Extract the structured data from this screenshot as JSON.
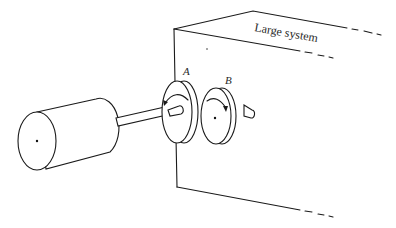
{
  "diagram": {
    "box_label": "Large system",
    "gear_a_label": "A",
    "gear_b_label": "B",
    "components": [
      {
        "name": "motor-cylinder"
      },
      {
        "name": "shaft"
      },
      {
        "name": "gear-A",
        "rotation": "counterclockwise"
      },
      {
        "name": "gear-B",
        "rotation": "clockwise"
      },
      {
        "name": "large-system-box"
      }
    ]
  }
}
